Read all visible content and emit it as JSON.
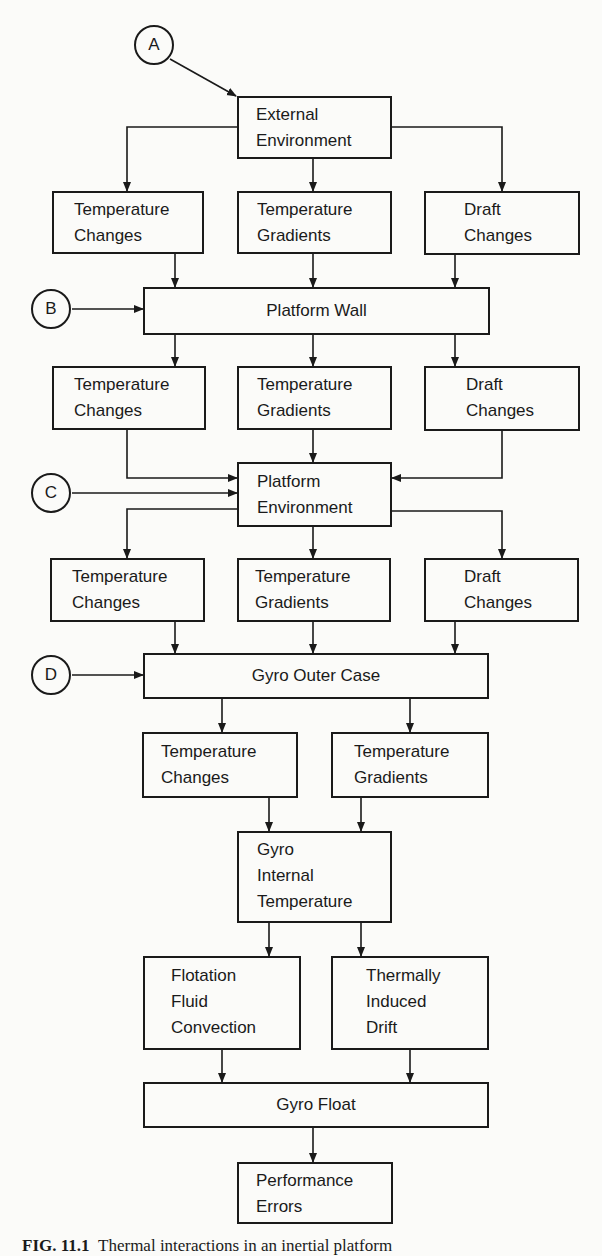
{
  "diagram": {
    "connectors": {
      "A": "A",
      "B": "B",
      "C": "C",
      "D": "D"
    },
    "nodes": {
      "external_environment": "External\nEnvironment",
      "row1_temp_changes": "Temperature\nChanges",
      "row1_temp_gradients": "Temperature\nGradients",
      "row1_draft_changes": "Draft\nChanges",
      "platform_wall": "Platform Wall",
      "row2_temp_changes": "Temperature\nChanges",
      "row2_temp_gradients": "Temperature\nGradients",
      "row2_draft_changes": "Draft\nChanges",
      "platform_environment": "Platform\nEnvironment",
      "row3_temp_changes": "Temperature\nChanges",
      "row3_temp_gradients": "Temperature\nGradients",
      "row3_draft_changes": "Draft\nChanges",
      "gyro_outer_case": "Gyro Outer Case",
      "row4_temp_changes": "Temperature\nChanges",
      "row4_temp_gradients": "Temperature\nGradients",
      "gyro_internal_temperature": "Gyro\nInternal\nTemperature",
      "flotation_fluid_convection": "Flotation\nFluid\nConvection",
      "thermally_induced_drift": "Thermally\nInduced\nDrift",
      "gyro_float": "Gyro Float",
      "performance_errors": "Performance\nErrors"
    },
    "edges": [
      [
        "A",
        "external_environment"
      ],
      [
        "external_environment",
        "row1_temp_changes"
      ],
      [
        "external_environment",
        "row1_temp_gradients"
      ],
      [
        "external_environment",
        "row1_draft_changes"
      ],
      [
        "row1_temp_changes",
        "platform_wall"
      ],
      [
        "row1_temp_gradients",
        "platform_wall"
      ],
      [
        "row1_draft_changes",
        "platform_wall"
      ],
      [
        "B",
        "platform_wall"
      ],
      [
        "platform_wall",
        "row2_temp_changes"
      ],
      [
        "platform_wall",
        "row2_temp_gradients"
      ],
      [
        "platform_wall",
        "row2_draft_changes"
      ],
      [
        "row2_temp_changes",
        "platform_environment"
      ],
      [
        "row2_temp_gradients",
        "platform_environment"
      ],
      [
        "row2_draft_changes",
        "platform_environment"
      ],
      [
        "C",
        "platform_environment"
      ],
      [
        "platform_environment",
        "row3_temp_changes"
      ],
      [
        "platform_environment",
        "row3_temp_gradients"
      ],
      [
        "platform_environment",
        "row3_draft_changes"
      ],
      [
        "row3_temp_changes",
        "gyro_outer_case"
      ],
      [
        "row3_temp_gradients",
        "gyro_outer_case"
      ],
      [
        "row3_draft_changes",
        "gyro_outer_case"
      ],
      [
        "D",
        "gyro_outer_case"
      ],
      [
        "gyro_outer_case",
        "row4_temp_changes"
      ],
      [
        "gyro_outer_case",
        "row4_temp_gradients"
      ],
      [
        "row4_temp_changes",
        "gyro_internal_temperature"
      ],
      [
        "row4_temp_gradients",
        "gyro_internal_temperature"
      ],
      [
        "gyro_internal_temperature",
        "flotation_fluid_convection"
      ],
      [
        "gyro_internal_temperature",
        "thermally_induced_drift"
      ],
      [
        "flotation_fluid_convection",
        "gyro_float"
      ],
      [
        "thermally_induced_drift",
        "gyro_float"
      ],
      [
        "gyro_float",
        "performance_errors"
      ]
    ]
  },
  "caption": {
    "label": "FIG. 11.1",
    "text": "Thermal interactions in an inertial platform"
  },
  "colors": {
    "ink": "#1a1a1a",
    "paper": "#fbfbf9"
  }
}
